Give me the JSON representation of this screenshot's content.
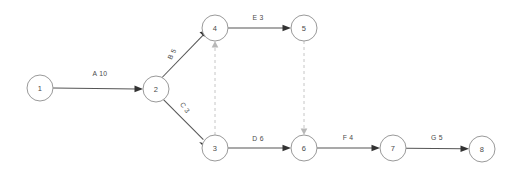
{
  "diagram": {
    "type": "activity-on-arrow-network",
    "colors": {
      "background": "#ffffff",
      "node_stroke": "#9a9a9a",
      "node_fill": "#ffffff",
      "edge_solid": "#555555",
      "edge_dummy": "#c6c6c6",
      "text": "#4a4a4a"
    },
    "nodes": [
      {
        "id": "1",
        "label": "1",
        "cx": 40,
        "cy": 88,
        "r": 13
      },
      {
        "id": "2",
        "label": "2",
        "cx": 156,
        "cy": 89,
        "r": 13
      },
      {
        "id": "3",
        "label": "3",
        "cx": 215,
        "cy": 148,
        "r": 13
      },
      {
        "id": "4",
        "label": "4",
        "cx": 215,
        "cy": 28,
        "r": 13
      },
      {
        "id": "5",
        "label": "5",
        "cx": 304,
        "cy": 28,
        "r": 13
      },
      {
        "id": "6",
        "label": "6",
        "cx": 304,
        "cy": 148,
        "r": 13
      },
      {
        "id": "7",
        "label": "7",
        "cx": 393,
        "cy": 148,
        "r": 13
      },
      {
        "id": "8",
        "label": "8",
        "cx": 482,
        "cy": 149,
        "r": 13
      }
    ],
    "edges": [
      {
        "id": "A",
        "from": "1",
        "to": "2",
        "label": "A 10",
        "activity": "A",
        "duration": "10",
        "style": "solid",
        "label_x": 100,
        "label_y": 76,
        "label_rotate": 0
      },
      {
        "id": "B",
        "from": "2",
        "to": "4",
        "label": "B 5",
        "activity": "B",
        "duration": "5",
        "style": "solid",
        "label_x": 174,
        "label_y": 55,
        "label_rotate": -63
      },
      {
        "id": "C",
        "from": "2",
        "to": "3",
        "label": "C 3",
        "activity": "C",
        "duration": "3",
        "style": "solid",
        "label_x": 183,
        "label_y": 109,
        "label_rotate": 56
      },
      {
        "id": "E",
        "from": "4",
        "to": "5",
        "label": "E 3",
        "activity": "E",
        "duration": "3",
        "style": "solid",
        "label_x": 258,
        "label_y": 20,
        "label_rotate": 0
      },
      {
        "id": "D",
        "from": "3",
        "to": "6",
        "label": "D 6",
        "activity": "D",
        "duration": "6",
        "style": "solid",
        "label_x": 258,
        "label_y": 141,
        "label_rotate": 0
      },
      {
        "id": "F",
        "from": "6",
        "to": "7",
        "label": "F 4",
        "activity": "F",
        "duration": "4",
        "style": "solid",
        "label_x": 348,
        "label_y": 140,
        "label_rotate": 0
      },
      {
        "id": "G",
        "from": "7",
        "to": "8",
        "label": "G 5",
        "activity": "G",
        "duration": "5",
        "style": "solid",
        "label_x": 437,
        "label_y": 140,
        "label_rotate": 0
      },
      {
        "id": "dummy-3-4",
        "from": "3",
        "to": "4",
        "label": "",
        "activity": "",
        "duration": "",
        "style": "dashed",
        "label_x": 0,
        "label_y": 0,
        "label_rotate": 0
      },
      {
        "id": "dummy-5-6",
        "from": "5",
        "to": "6",
        "label": "",
        "activity": "",
        "duration": "",
        "style": "dashed",
        "label_x": 0,
        "label_y": 0,
        "label_rotate": 0
      }
    ]
  }
}
